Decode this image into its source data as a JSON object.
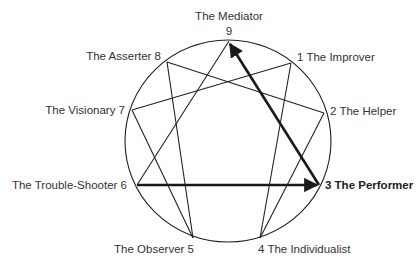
{
  "diagram": {
    "type": "enneagram",
    "circle": {
      "cx": 228,
      "cy": 141,
      "r": 102
    },
    "points": [
      {
        "id": "9",
        "name": "The Mediator",
        "x": 229,
        "y": 41
      },
      {
        "id": "1",
        "name": "The Improver",
        "x": 291,
        "y": 63
      },
      {
        "id": "2",
        "name": "The Helper",
        "x": 324,
        "y": 113
      },
      {
        "id": "3",
        "name": "The Performer",
        "x": 319,
        "y": 185,
        "highlighted": true
      },
      {
        "id": "4",
        "name": "The Individualist",
        "x": 260,
        "y": 238
      },
      {
        "id": "5",
        "name": "The Observer",
        "x": 193,
        "y": 238
      },
      {
        "id": "6",
        "name": "The Trouble-Shooter",
        "x": 137,
        "y": 185
      },
      {
        "id": "7",
        "name": "The Visionary",
        "x": 132,
        "y": 110
      },
      {
        "id": "8",
        "name": "The Asserter",
        "x": 167,
        "y": 62
      }
    ],
    "labels": {
      "p9_name": "The Mediator",
      "p9_num": "9",
      "p1": "1 The Improver",
      "p2": "2 The Helper",
      "p3": "3 The Performer",
      "p4": "4 The Individualist",
      "p5": "The Observer 5",
      "p6": "The Trouble-Shooter 6",
      "p7": "The Visionary 7",
      "p8": "The Asserter 8"
    },
    "edges_thin": [
      [
        "9",
        "6"
      ],
      [
        "1",
        "4"
      ],
      [
        "4",
        "2"
      ],
      [
        "2",
        "8"
      ],
      [
        "8",
        "5"
      ],
      [
        "5",
        "7"
      ],
      [
        "7",
        "1"
      ]
    ],
    "edges_arrows": [
      {
        "from": "6",
        "to": "3",
        "style": "bold-arrow"
      },
      {
        "from": "3",
        "to": "9",
        "style": "bold-arrow"
      }
    ]
  }
}
